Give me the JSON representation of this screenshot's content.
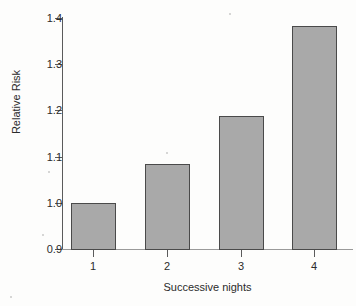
{
  "chart_data": {
    "type": "bar",
    "title": "",
    "subtitle": "",
    "xlabel": "Successive nights",
    "ylabel": "Relative Risk",
    "categories": [
      "1",
      "2",
      "3",
      "4"
    ],
    "values": [
      1.0,
      1.083,
      1.187,
      1.383
    ],
    "series": [
      {
        "name": "Relative Risk",
        "values": [
          1.0,
          1.083,
          1.187,
          1.383
        ]
      }
    ],
    "ylim": [
      0.9,
      1.4
    ],
    "yticks": [
      0.9,
      1.0,
      1.1,
      1.2,
      1.3,
      1.4
    ],
    "ytick_labels": [
      "0.9",
      "1.0",
      "1.1",
      "1.2",
      "1.3",
      "1.4"
    ],
    "xtick_labels": [
      "1",
      "2",
      "3",
      "4"
    ],
    "grid": false,
    "legend": false,
    "legend_position": "none",
    "bar_color": "#a9a9a9",
    "bar_edge_color": "#4a4a4a",
    "axis_color": "#5b5b5b",
    "text_color": "#2b2b2b",
    "background_color": "#fdfdfc",
    "annotations": []
  }
}
